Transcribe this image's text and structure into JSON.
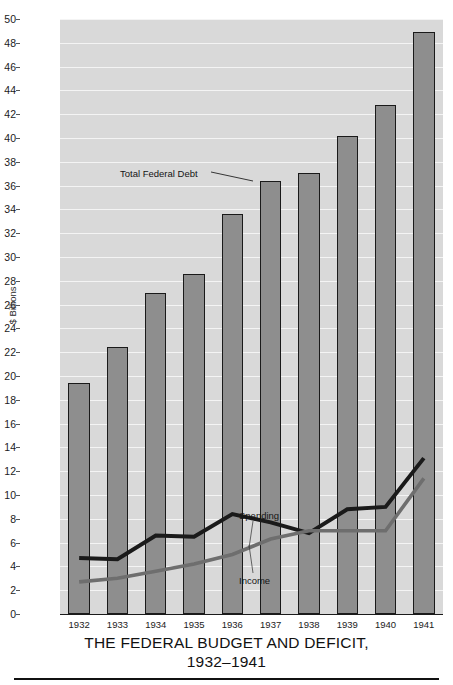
{
  "figure": {
    "title_line1": "THE FEDERAL BUDGET AND DEFICIT,",
    "title_line2": "1932–1941",
    "ylabel": "$ Billions"
  },
  "annotations": {
    "debt": "Total Federal Debt",
    "spending": "Spending",
    "income": "Income"
  },
  "colors": {
    "bar_fill": "#8e8e8e",
    "bar_stroke": "#1a1a1a",
    "plot_bg": "#d9d9d9",
    "gridline": "#f4f4f4",
    "spending_line": "#1a1a1a",
    "income_line": "#6e6e6e"
  },
  "chart_data": {
    "type": "bar",
    "title": "THE FEDERAL BUDGET AND DEFICIT, 1932–1941",
    "xlabel": "",
    "ylabel": "$ Billions",
    "ylim": [
      0,
      50
    ],
    "ytick_step": 2,
    "grid": true,
    "legend": "annotated inline (Total Federal Debt, Spending, Income)",
    "categories": [
      "1932",
      "1933",
      "1934",
      "1935",
      "1936",
      "1937",
      "1938",
      "1939",
      "1940",
      "1941"
    ],
    "yticks": [
      0,
      2,
      4,
      6,
      8,
      10,
      12,
      14,
      16,
      18,
      20,
      22,
      24,
      26,
      28,
      30,
      32,
      34,
      36,
      38,
      40,
      42,
      44,
      46,
      48,
      50
    ],
    "series": [
      {
        "name": "Total Federal Debt",
        "render": "bar",
        "values": [
          19.4,
          22.4,
          27.0,
          28.6,
          33.6,
          36.4,
          37.1,
          40.2,
          42.8,
          48.9
        ]
      },
      {
        "name": "Spending",
        "render": "line",
        "values": [
          4.7,
          4.6,
          6.6,
          6.5,
          8.4,
          7.7,
          6.8,
          8.8,
          9.0,
          13.1
        ]
      },
      {
        "name": "Income",
        "render": "line",
        "values": [
          2.7,
          3.0,
          3.6,
          4.2,
          5.0,
          6.3,
          7.0,
          7.0,
          7.0,
          11.4
        ]
      }
    ]
  }
}
